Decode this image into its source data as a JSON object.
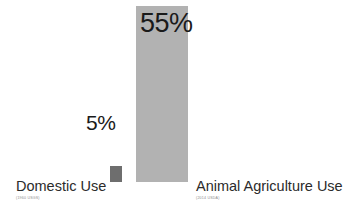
{
  "chart_data": {
    "type": "bar",
    "title": "",
    "subtitle": "",
    "xlabel": "",
    "ylabel": "",
    "ylim": [
      0,
      60
    ],
    "grid": false,
    "legend": "none",
    "unit": "%",
    "categories": [
      "Domestic Use",
      "Animal Agriculture Use"
    ],
    "values": [
      5,
      55
    ],
    "value_labels": [
      "5%",
      "55%"
    ],
    "sources": [
      "(1960 USGS)",
      "(2014 USDA)"
    ],
    "colors": [
      "#6e6e6e",
      "#b2b2b2"
    ],
    "background": "#ffffff",
    "label_color": "#2b2b2b",
    "value_color": "#1a1a1a",
    "source_color": "#8c8c8c"
  },
  "bars": [
    {
      "key": "domestic",
      "label": "Domestic Use",
      "source": "(1960 USGS)",
      "value_label": "5%"
    },
    {
      "key": "animal",
      "label": "Animal Agriculture Use",
      "source": "(2014 USDA)",
      "value_label": "55%"
    }
  ]
}
